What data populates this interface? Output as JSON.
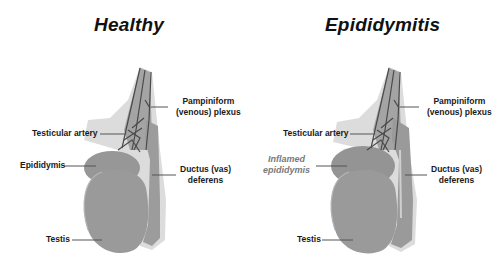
{
  "figure": {
    "background": "#ffffff",
    "colors": {
      "organ_fill": "#9a9a9a",
      "organ_shadow": "#d8d8d8",
      "vessel_stroke": "#4a4a4a",
      "label_text": "#1a1a1a",
      "inflamed_label_text": "#7a7a7a",
      "leader_line": "#555555"
    }
  },
  "panels": [
    {
      "title": "Healthy",
      "labels": {
        "pampiniform": [
          "Pampiniform",
          "(venous) plexus"
        ],
        "testicular_artery": "Testicular artery",
        "epididymis": "Epididymis",
        "ductus": [
          "Ductus (vas)",
          "deferens"
        ],
        "testis": "Testis"
      }
    },
    {
      "title": "Epididymitis",
      "labels": {
        "pampiniform": [
          "Pampiniform",
          "(venous) plexus"
        ],
        "testicular_artery": "Testicular artery",
        "epididymis": [
          "Inflamed",
          "epididymis"
        ],
        "ductus": [
          "Ductus (vas)",
          "deferens"
        ],
        "testis": "Testis"
      }
    }
  ]
}
